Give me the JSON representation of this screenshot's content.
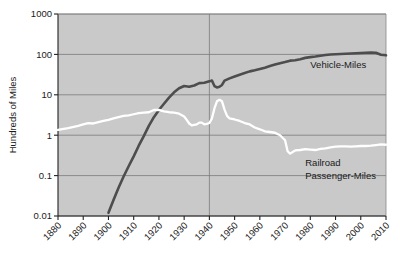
{
  "chart_data": {
    "type": "line",
    "title": "",
    "xlabel": "",
    "ylabel": "Hundreds of Miles",
    "yscale": "log",
    "ylim": [
      0.01,
      1000
    ],
    "xlim": [
      1880,
      2010
    ],
    "ytick_labels": [
      "1000",
      "100",
      "10",
      "1",
      "0.1",
      "0.01"
    ],
    "ytick_values": [
      1000,
      100,
      10,
      1,
      0.1,
      0.01
    ],
    "xtick_labels": [
      "1880",
      "1890",
      "1900",
      "1910",
      "1920",
      "1930",
      "1940",
      "1950",
      "1960",
      "1970",
      "1980",
      "1990",
      "2000",
      "2010"
    ],
    "xtick_values": [
      1880,
      1890,
      1900,
      1910,
      1920,
      1930,
      1940,
      1950,
      1960,
      1970,
      1980,
      1990,
      2000,
      2010
    ],
    "grid": true,
    "grid_horizontal": true,
    "grid_vertical_at": [
      1940
    ],
    "plot_background": "#c9c9c9",
    "legend_position": "inline-right",
    "series": [
      {
        "name": "Vehicle-Miles",
        "label": "Vehicle-Miles",
        "color": "#4d4d4d",
        "label_x": 1980,
        "label_y": 45,
        "x": [
          1900,
          1902,
          1904,
          1906,
          1908,
          1910,
          1912,
          1914,
          1916,
          1918,
          1920,
          1922,
          1924,
          1926,
          1928,
          1930,
          1932,
          1934,
          1936,
          1938,
          1940,
          1941,
          1942,
          1943,
          1944,
          1945,
          1946,
          1948,
          1950,
          1952,
          1954,
          1956,
          1958,
          1960,
          1962,
          1964,
          1966,
          1968,
          1970,
          1972,
          1974,
          1976,
          1978,
          1980,
          1982,
          1984,
          1986,
          1988,
          1990,
          1992,
          1994,
          1996,
          1998,
          2000,
          2002,
          2004,
          2006,
          2008,
          2010
        ],
        "y": [
          0.012,
          0.025,
          0.05,
          0.095,
          0.17,
          0.3,
          0.55,
          0.95,
          1.7,
          2.8,
          4.2,
          6.0,
          8.5,
          11.5,
          14.5,
          16.5,
          15.8,
          17.0,
          19.5,
          19.8,
          21.5,
          22.5,
          16.5,
          15.2,
          15.8,
          17.5,
          22.5,
          25.5,
          28.5,
          31.5,
          34.5,
          38.0,
          40.5,
          43.5,
          47.0,
          51.5,
          56.0,
          60.5,
          64.5,
          70.0,
          71.5,
          76.0,
          82.0,
          85.5,
          88.5,
          93.0,
          96.5,
          99.0,
          101.0,
          102.5,
          104.0,
          105.5,
          107.0,
          108.0,
          109.5,
          110.5,
          110.0,
          98.0,
          95.0
        ]
      },
      {
        "name": "Railroad Passenger-Miles",
        "label": "Railroad\nPassenger-Miles",
        "label_line1": "Railroad",
        "label_line2": "Passenger-Miles",
        "color": "#ffffff",
        "label_x": 1978,
        "label_y": 0.17,
        "x": [
          1880,
          1884,
          1888,
          1890,
          1892,
          1894,
          1896,
          1898,
          1900,
          1902,
          1904,
          1906,
          1908,
          1910,
          1912,
          1914,
          1916,
          1918,
          1920,
          1922,
          1924,
          1926,
          1928,
          1930,
          1931,
          1932,
          1933,
          1934,
          1935,
          1936,
          1937,
          1938,
          1939,
          1940,
          1941,
          1942,
          1943,
          1944,
          1945,
          1946,
          1947,
          1948,
          1950,
          1952,
          1954,
          1956,
          1958,
          1960,
          1962,
          1964,
          1966,
          1968,
          1970,
          1971,
          1972,
          1974,
          1976,
          1978,
          1980,
          1982,
          1984,
          1986,
          1988,
          1990,
          1992,
          1994,
          1996,
          1998,
          2000,
          2002,
          2004,
          2006,
          2008,
          2010
        ],
        "y": [
          1.35,
          1.5,
          1.7,
          1.85,
          2.0,
          1.95,
          2.1,
          2.25,
          2.4,
          2.6,
          2.8,
          3.0,
          3.1,
          3.3,
          3.5,
          3.6,
          3.7,
          4.2,
          4.25,
          3.9,
          3.7,
          3.6,
          3.4,
          2.9,
          2.4,
          1.95,
          1.75,
          1.8,
          1.85,
          2.05,
          2.05,
          1.85,
          1.9,
          2.0,
          2.6,
          4.6,
          6.9,
          7.5,
          6.9,
          4.3,
          3.0,
          2.6,
          2.45,
          2.25,
          2.0,
          1.85,
          1.55,
          1.4,
          1.25,
          1.2,
          1.15,
          1.0,
          0.75,
          0.4,
          0.35,
          0.42,
          0.43,
          0.45,
          0.44,
          0.43,
          0.46,
          0.47,
          0.5,
          0.52,
          0.53,
          0.53,
          0.52,
          0.53,
          0.54,
          0.54,
          0.55,
          0.57,
          0.59,
          0.58
        ]
      }
    ]
  }
}
